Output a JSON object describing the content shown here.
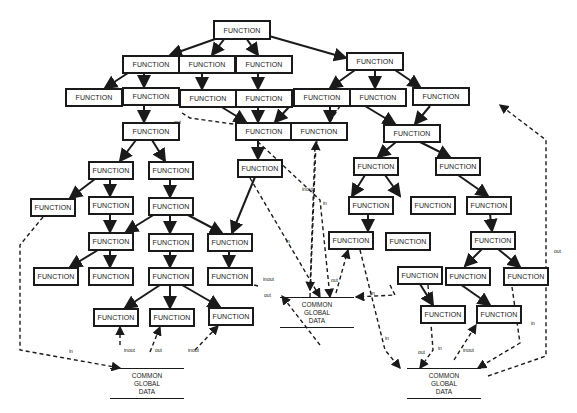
{
  "diagram": {
    "node_label": "FUNCTION",
    "store_lines": [
      "COMMON",
      "GLOBAL",
      "DATA"
    ],
    "nodes": [
      {
        "id": "root",
        "x": 213,
        "y": 20,
        "w": 58,
        "h": 20
      },
      {
        "id": "a1",
        "x": 122,
        "y": 55,
        "w": 58,
        "h": 19
      },
      {
        "id": "a2",
        "x": 178,
        "y": 55,
        "w": 58,
        "h": 19
      },
      {
        "id": "a3",
        "x": 235,
        "y": 55,
        "w": 58,
        "h": 19
      },
      {
        "id": "b0",
        "x": 346,
        "y": 52,
        "w": 58,
        "h": 19
      },
      {
        "id": "c1",
        "x": 65,
        "y": 88,
        "w": 58,
        "h": 19
      },
      {
        "id": "c2",
        "x": 122,
        "y": 87,
        "w": 58,
        "h": 19
      },
      {
        "id": "c3",
        "x": 179,
        "y": 89,
        "w": 58,
        "h": 19
      },
      {
        "id": "c4",
        "x": 235,
        "y": 89,
        "w": 58,
        "h": 19
      },
      {
        "id": "b1",
        "x": 293,
        "y": 88,
        "w": 58,
        "h": 19
      },
      {
        "id": "b2",
        "x": 349,
        "y": 88,
        "w": 58,
        "h": 19
      },
      {
        "id": "b3",
        "x": 412,
        "y": 87,
        "w": 58,
        "h": 19
      },
      {
        "id": "d1",
        "x": 122,
        "y": 122,
        "w": 58,
        "h": 19
      },
      {
        "id": "e1",
        "x": 235,
        "y": 122,
        "w": 58,
        "h": 19
      },
      {
        "id": "e2",
        "x": 290,
        "y": 122,
        "w": 58,
        "h": 19
      },
      {
        "id": "f1",
        "x": 383,
        "y": 124,
        "w": 58,
        "h": 19
      },
      {
        "id": "g1",
        "x": 88,
        "y": 161,
        "w": 46,
        "h": 19
      },
      {
        "id": "g2",
        "x": 148,
        "y": 161,
        "w": 46,
        "h": 19
      },
      {
        "id": "e3",
        "x": 237,
        "y": 159,
        "w": 46,
        "h": 19
      },
      {
        "id": "f2",
        "x": 353,
        "y": 157,
        "w": 46,
        "h": 19
      },
      {
        "id": "f3",
        "x": 435,
        "y": 157,
        "w": 46,
        "h": 19
      },
      {
        "id": "h1",
        "x": 30,
        "y": 198,
        "w": 46,
        "h": 19
      },
      {
        "id": "h2",
        "x": 88,
        "y": 196,
        "w": 46,
        "h": 19
      },
      {
        "id": "h3",
        "x": 148,
        "y": 197,
        "w": 46,
        "h": 19
      },
      {
        "id": "f4",
        "x": 348,
        "y": 196,
        "w": 46,
        "h": 19
      },
      {
        "id": "f5",
        "x": 410,
        "y": 196,
        "w": 46,
        "h": 19
      },
      {
        "id": "f6",
        "x": 466,
        "y": 196,
        "w": 46,
        "h": 19
      },
      {
        "id": "i1",
        "x": 88,
        "y": 232,
        "w": 46,
        "h": 19
      },
      {
        "id": "i2",
        "x": 148,
        "y": 233,
        "w": 46,
        "h": 19
      },
      {
        "id": "i3",
        "x": 207,
        "y": 233,
        "w": 46,
        "h": 19
      },
      {
        "id": "f7",
        "x": 328,
        "y": 231,
        "w": 46,
        "h": 19
      },
      {
        "id": "f8",
        "x": 385,
        "y": 232,
        "w": 46,
        "h": 19
      },
      {
        "id": "f9",
        "x": 470,
        "y": 231,
        "w": 46,
        "h": 19
      },
      {
        "id": "j1",
        "x": 33,
        "y": 267,
        "w": 46,
        "h": 19
      },
      {
        "id": "j2",
        "x": 88,
        "y": 267,
        "w": 46,
        "h": 19
      },
      {
        "id": "j3",
        "x": 148,
        "y": 267,
        "w": 46,
        "h": 19
      },
      {
        "id": "j4",
        "x": 207,
        "y": 267,
        "w": 46,
        "h": 19
      },
      {
        "id": "f10",
        "x": 397,
        "y": 266,
        "w": 46,
        "h": 19
      },
      {
        "id": "f11",
        "x": 445,
        "y": 267,
        "w": 46,
        "h": 19
      },
      {
        "id": "f12",
        "x": 503,
        "y": 267,
        "w": 46,
        "h": 19
      },
      {
        "id": "k1",
        "x": 93,
        "y": 308,
        "w": 46,
        "h": 19
      },
      {
        "id": "k2",
        "x": 149,
        "y": 308,
        "w": 46,
        "h": 19
      },
      {
        "id": "k3",
        "x": 208,
        "y": 307,
        "w": 46,
        "h": 19
      },
      {
        "id": "f13",
        "x": 420,
        "y": 305,
        "w": 46,
        "h": 19
      },
      {
        "id": "f14",
        "x": 476,
        "y": 305,
        "w": 46,
        "h": 19
      }
    ],
    "stores": [
      {
        "id": "store-left",
        "x": 110,
        "y": 368,
        "w": 74
      },
      {
        "id": "store-center",
        "x": 280,
        "y": 297,
        "w": 74
      },
      {
        "id": "store-right",
        "x": 407,
        "y": 368,
        "w": 74
      }
    ],
    "edge_labels": [
      {
        "text": "out",
        "x": 174,
        "y": 119
      },
      {
        "text": "inout",
        "x": 124,
        "y": 347
      },
      {
        "text": "out",
        "x": 155,
        "y": 347
      },
      {
        "text": "inout",
        "x": 188,
        "y": 347
      },
      {
        "text": "inout",
        "x": 263,
        "y": 276
      },
      {
        "text": "out",
        "x": 264,
        "y": 292
      },
      {
        "text": "inout",
        "x": 302,
        "y": 186
      },
      {
        "text": "in",
        "x": 323,
        "y": 200
      },
      {
        "text": "in",
        "x": 286,
        "y": 238
      },
      {
        "text": "out",
        "x": 331,
        "y": 277
      },
      {
        "text": "in",
        "x": 371,
        "y": 290
      },
      {
        "text": "in",
        "x": 385,
        "y": 335
      },
      {
        "text": "out",
        "x": 418,
        "y": 349
      },
      {
        "text": "in",
        "x": 438,
        "y": 345
      },
      {
        "text": "inout",
        "x": 463,
        "y": 347
      },
      {
        "text": "in",
        "x": 531,
        "y": 320
      },
      {
        "text": "out",
        "x": 554,
        "y": 248
      },
      {
        "text": "in",
        "x": 69,
        "y": 348
      }
    ]
  }
}
